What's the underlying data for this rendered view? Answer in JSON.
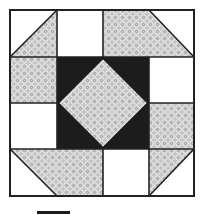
{
  "figure": {
    "title": "Shoo-fly / Churn Dash style quilt block",
    "colors": {
      "background": "#ffffff",
      "white_patch": "#ffffff",
      "pattern_base": "#c8c8c8",
      "pattern_ring": "#f4f4f4",
      "pattern_dot": "#8a8a8a",
      "dark_center": "#1c1c1c",
      "outline": "#222222"
    },
    "grid": {
      "left": 10,
      "top": 10,
      "right": 194,
      "bottom": 196,
      "cols": [
        10,
        57,
        103,
        149,
        194
      ],
      "rows": [
        10,
        57,
        103,
        149,
        196
      ]
    },
    "patches": [
      {
        "name": "top-left-corner",
        "type": "half-square-triangle",
        "white_side": "top-left",
        "pattern_side": "bottom-right"
      },
      {
        "name": "top-white-square",
        "type": "square",
        "fill": "white"
      },
      {
        "name": "top-right-corner",
        "type": "pattern-with-clipped-triangle",
        "white_side": "top-right"
      },
      {
        "name": "right-white-square",
        "type": "square",
        "fill": "white"
      },
      {
        "name": "left-pattern-square",
        "type": "square",
        "fill": "pattern"
      },
      {
        "name": "left-white-square",
        "type": "square",
        "fill": "white"
      },
      {
        "name": "right-pattern-square",
        "type": "square",
        "fill": "pattern"
      },
      {
        "name": "bottom-left-corner",
        "type": "pattern-with-clipped-triangle",
        "white_side": "bottom-left"
      },
      {
        "name": "bottom-white-square",
        "type": "square",
        "fill": "white"
      },
      {
        "name": "bottom-right-corner",
        "type": "half-square-triangle",
        "white_side": "bottom-right",
        "pattern_side": "top-left"
      },
      {
        "name": "dark-center-square",
        "type": "square",
        "fill": "dark"
      },
      {
        "name": "center-diamond",
        "type": "diamond",
        "fill": "pattern"
      }
    ],
    "scale_bar": {
      "visible": true
    }
  }
}
